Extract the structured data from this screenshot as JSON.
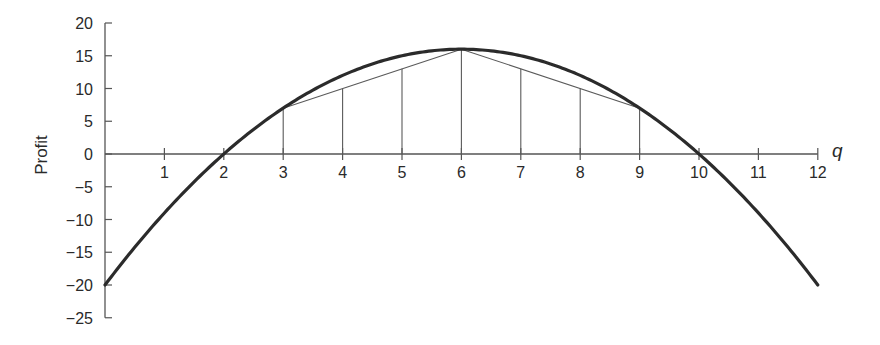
{
  "chart_data": {
    "type": "line",
    "title": "",
    "xlabel": "q",
    "ylabel": "Profit",
    "xlim": [
      0,
      12
    ],
    "ylim": [
      -25,
      20
    ],
    "x_ticks": [
      1,
      2,
      3,
      4,
      5,
      6,
      7,
      8,
      9,
      10,
      11,
      12
    ],
    "x_tick_labels": [
      "1",
      "2",
      "3",
      "4",
      "5",
      "6",
      "7",
      "8",
      "9",
      "10",
      "11",
      "12"
    ],
    "y_ticks": [
      20,
      15,
      10,
      5,
      0,
      -5,
      -10,
      -15,
      -20,
      -25
    ],
    "y_tick_labels": [
      "20",
      "15",
      "10",
      "5",
      "0",
      "−5",
      "−10",
      "−15",
      "−20",
      "−25"
    ],
    "grid": false,
    "legend": "none",
    "series": [
      {
        "name": "profit-curve",
        "function": "-q^2 + 12q - 20",
        "x": [
          0,
          1,
          2,
          3,
          4,
          5,
          6,
          7,
          8,
          9,
          10,
          11,
          12
        ],
        "values": [
          -20,
          -9,
          0,
          7,
          12,
          15,
          16,
          15,
          12,
          7,
          0,
          -9,
          -20
        ]
      },
      {
        "name": "chord-left",
        "x": [
          3,
          6
        ],
        "values": [
          7,
          16
        ]
      },
      {
        "name": "chord-right",
        "x": [
          6,
          9
        ],
        "values": [
          16,
          7
        ]
      }
    ],
    "vertical_segments": [
      {
        "x": 3,
        "top": 7
      },
      {
        "x": 4,
        "top": 10
      },
      {
        "x": 5,
        "top": 13
      },
      {
        "x": 6,
        "top": 16
      },
      {
        "x": 7,
        "top": 13
      },
      {
        "x": 8,
        "top": 10
      },
      {
        "x": 9,
        "top": 7
      }
    ],
    "colors": {
      "curve": "#2b2b2b",
      "axis": "#555555",
      "thin": "#5a5a5a"
    }
  }
}
